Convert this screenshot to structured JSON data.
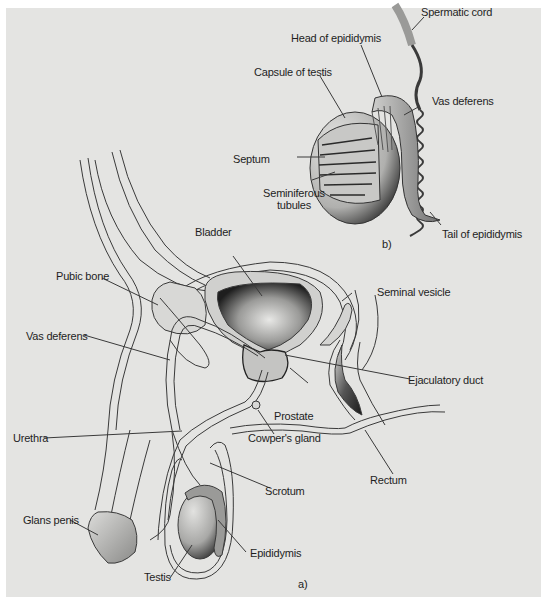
{
  "figure": {
    "panel_a_marker": "a)",
    "panel_b_marker": "b)",
    "colors": {
      "background": "#e4e4e2",
      "outline": "#3a3a3a",
      "tissue_fill": "#d2d2d0",
      "dark_shade": "#2a2a2a",
      "label_text": "#1e1e1e"
    }
  },
  "panel_b": {
    "title_marker": "b)",
    "labels": {
      "spermatic_cord": "Spermatic cord",
      "head_of_epididymis": "Head of epididymis",
      "capsule_of_testis": "Capsule of testis",
      "vas_deferens": "Vas deferens",
      "septum": "Septum",
      "seminiferous_line1": "Seminiferous",
      "seminiferous_line2": "tubules",
      "tail_of_epididymis": "Tail of epididymis"
    }
  },
  "panel_a": {
    "title_marker": "a)",
    "labels": {
      "bladder": "Bladder",
      "pubic_bone": "Pubic bone",
      "seminal_vesicle": "Seminal vesicle",
      "vas_deferens": "Vas deferens",
      "ejaculatory_duct": "Ejaculatory duct",
      "prostate": "Prostate",
      "urethra": "Urethra",
      "cowpers_gland": "Cowper's gland",
      "scrotum": "Scrotum",
      "rectum": "Rectum",
      "glans_penis": "Glans penis",
      "epididymis": "Epididymis",
      "testis": "Testis"
    }
  }
}
